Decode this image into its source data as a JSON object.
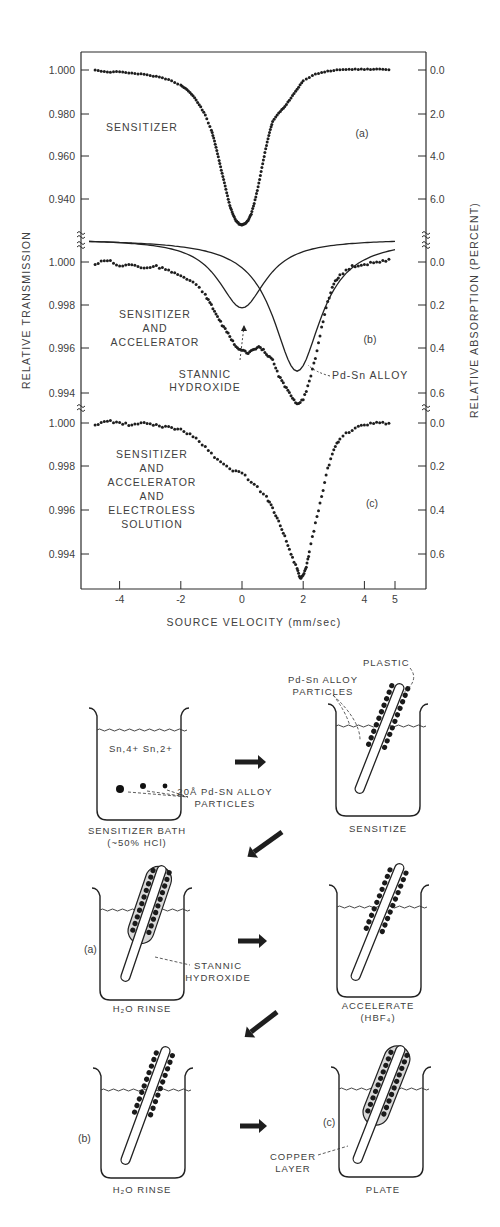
{
  "chart_data": [
    {
      "type": "scatter",
      "panel": "(a)",
      "title": "SENSITIZER",
      "xlabel": "SOURCE VELOCITY (mm/sec)",
      "ylabel": "RELATIVE TRANSMISSION",
      "ylabel_right": "RELATIVE ABSORPTION (PERCENT)",
      "xlim": [
        -5,
        5
      ],
      "ylim": [
        0.924,
        1.004
      ],
      "yticks_left": [
        "1.000",
        "0.980",
        "0.960",
        "0.940"
      ],
      "yticks_left_values": [
        1.0,
        0.98,
        0.96,
        0.94
      ],
      "yticks_right": [
        "0.0",
        "2.0",
        "4.0",
        "6.0"
      ],
      "series": [
        {
          "name": "SENSITIZER data",
          "style": "points",
          "x": [
            -4.8,
            -4.4,
            -4.0,
            -3.6,
            -3.2,
            -2.8,
            -2.4,
            -2.0,
            -1.8,
            -1.6,
            -1.4,
            -1.2,
            -1.0,
            -0.9,
            -0.8,
            -0.7,
            -0.6,
            -0.5,
            -0.4,
            -0.3,
            -0.2,
            -0.1,
            0.0,
            0.1,
            0.2,
            0.3,
            0.4,
            0.5,
            0.6,
            0.7,
            0.8,
            0.9,
            1.0,
            1.2,
            1.4,
            1.6,
            1.8,
            2.0,
            2.4,
            2.8,
            3.2,
            3.6,
            4.0,
            4.4,
            4.8
          ],
          "y": [
            1.0,
            0.999,
            0.9992,
            0.9985,
            0.998,
            0.997,
            0.9955,
            0.993,
            0.991,
            0.988,
            0.984,
            0.979,
            0.972,
            0.967,
            0.961,
            0.955,
            0.949,
            0.943,
            0.937,
            0.933,
            0.93,
            0.9285,
            0.928,
            0.9285,
            0.93,
            0.933,
            0.938,
            0.944,
            0.951,
            0.958,
            0.965,
            0.971,
            0.976,
            0.98,
            0.983,
            0.987,
            0.991,
            0.995,
            0.998,
            0.9995,
            1.0002,
            1.0003,
            1.0004,
            1.0004,
            1.0003
          ]
        }
      ]
    },
    {
      "type": "scatter",
      "panel": "(b)",
      "title": "SENSITIZER AND ACCELERATOR",
      "xlim": [
        -5,
        5
      ],
      "ylim": [
        0.9925,
        1.0006
      ],
      "yticks_left": [
        "1.000",
        "0.998",
        "0.996",
        "0.994"
      ],
      "yticks_left_values": [
        1.0,
        0.998,
        0.996,
        0.994
      ],
      "yticks_right": [
        "0.0",
        "0.2",
        "0.4",
        "0.6"
      ],
      "annotations": [
        "STANNIC HYDROXIDE",
        "Pd-Sn ALLOY"
      ],
      "series": [
        {
          "name": "SENSITIZER AND ACCELERATOR data",
          "style": "points",
          "x": [
            -4.8,
            -4.4,
            -4.0,
            -3.6,
            -3.2,
            -2.8,
            -2.4,
            -2.0,
            -1.6,
            -1.2,
            -1.0,
            -0.8,
            -0.6,
            -0.4,
            -0.2,
            0.0,
            0.2,
            0.4,
            0.6,
            0.8,
            1.0,
            1.2,
            1.4,
            1.6,
            1.8,
            2.0,
            2.2,
            2.4,
            2.6,
            2.8,
            3.0,
            3.2,
            3.6,
            4.0,
            4.4,
            4.8
          ],
          "y": [
            0.9999,
            1.0001,
            0.9998,
            0.9999,
            0.9997,
            0.9998,
            0.9996,
            0.9994,
            0.9991,
            0.9985,
            0.998,
            0.9975,
            0.997,
            0.9966,
            0.9961,
            0.996,
            0.9958,
            0.996,
            0.9961,
            0.9958,
            0.9955,
            0.9948,
            0.9943,
            0.9939,
            0.9935,
            0.9937,
            0.9945,
            0.9956,
            0.997,
            0.9982,
            0.999,
            0.9994,
            0.9998,
            0.9999,
            1.0,
            1.0001
          ]
        },
        {
          "name": "STANNIC HYDROXIDE fit",
          "style": "line",
          "center": 0.0,
          "depth": 0.0027,
          "baseline": 1.0006
        },
        {
          "name": "Pd-Sn ALLOY fit",
          "style": "line",
          "center": 1.8,
          "depth": 0.0056,
          "baseline": 1.0006
        }
      ]
    },
    {
      "type": "scatter",
      "panel": "(c)",
      "title": "SENSITIZER AND ACCELERATOR AND ELECTROLESS SOLUTION",
      "xlim": [
        -5,
        5
      ],
      "ylim": [
        0.9922,
        1.0003
      ],
      "xticks": [
        "-4",
        "-2",
        "0",
        "2",
        "4",
        "5"
      ],
      "xticks_values": [
        -4,
        -2,
        0,
        2,
        4,
        5
      ],
      "yticks_left": [
        "1.000",
        "0.998",
        "0.996",
        "0.994"
      ],
      "yticks_left_values": [
        1.0,
        0.998,
        0.996,
        0.994
      ],
      "yticks_right": [
        "0.0",
        "0.2",
        "0.4",
        "0.6"
      ],
      "series": [
        {
          "name": "SENSITIZER AND ACCELERATOR AND ELECTROLESS SOLUTION data",
          "style": "points",
          "x": [
            -4.8,
            -4.4,
            -4.0,
            -3.6,
            -3.2,
            -2.8,
            -2.4,
            -2.0,
            -1.6,
            -1.2,
            -0.8,
            -0.4,
            0.0,
            0.4,
            0.8,
            1.0,
            1.2,
            1.4,
            1.6,
            1.8,
            1.9,
            2.0,
            2.1,
            2.2,
            2.4,
            2.6,
            2.8,
            3.0,
            3.2,
            3.6,
            4.0,
            4.4,
            4.8
          ],
          "y": [
            0.9999,
            1.0001,
            1.0,
            0.9999,
            1.0,
            0.9999,
            0.9998,
            0.9997,
            0.9994,
            0.9989,
            0.9983,
            0.9979,
            0.9977,
            0.9972,
            0.9966,
            0.9961,
            0.9955,
            0.9948,
            0.994,
            0.9933,
            0.9929,
            0.993,
            0.9934,
            0.9941,
            0.9954,
            0.9966,
            0.9979,
            0.9988,
            0.9993,
            0.9997,
            0.9999,
            1.0,
            1.0
          ]
        }
      ]
    }
  ],
  "plot": {
    "left_axis_title": "RELATIVE TRANSMISSION",
    "right_axis_title": "RELATIVE ABSORPTION (PERCENT)",
    "x_axis_title": "SOURCE VELOCITY (mm/sec)",
    "panel_a": {
      "label": "SENSITIZER",
      "tag": "(a)"
    },
    "panel_b": {
      "label_lines": [
        "SENSITIZER",
        "AND",
        "ACCELERATOR"
      ],
      "tag": "(b)",
      "annotation_stannic": [
        "STANNIC",
        "HYDROXIDE"
      ],
      "annotation_pdsn": "Pd-Sn ALLOY"
    },
    "panel_c": {
      "label_lines": [
        "SENSITIZER",
        "AND",
        "ACCELERATOR",
        "AND",
        "ELECTROLESS",
        "SOLUTION"
      ],
      "tag": "(c)"
    }
  },
  "diagram": {
    "steps": [
      {
        "id": "sensitizer-bath",
        "caption_lines": [
          "SENSITIZER BATH",
          "(~50% HCl)"
        ],
        "ions": "Sn,4+ Sn,2+",
        "particle_label": [
          "20Å Pd-SN ALLOY",
          "PARTICLES"
        ]
      },
      {
        "id": "sensitize",
        "caption_lines": [
          "SENSITIZE"
        ],
        "labels": {
          "plastic": "PLASTIC",
          "particles": [
            "Pd-Sn ALLOY",
            "PARTICLES"
          ]
        }
      },
      {
        "id": "h2o-rinse-a",
        "caption_lines": [
          "H₂O RINSE"
        ],
        "tag": "(a)",
        "labels": {
          "stannic": [
            "STANNIC",
            "HYDROXIDE"
          ]
        }
      },
      {
        "id": "accelerate",
        "caption_lines": [
          "ACCELERATE",
          "(HBF₄)"
        ]
      },
      {
        "id": "h2o-rinse-b",
        "caption_lines": [
          "H₂O RINSE"
        ],
        "tag": "(b)"
      },
      {
        "id": "plate",
        "caption_lines": [
          "PLATE"
        ],
        "tag": "(c)",
        "labels": {
          "copper": [
            "COPPER",
            "LAYER"
          ]
        }
      }
    ]
  }
}
